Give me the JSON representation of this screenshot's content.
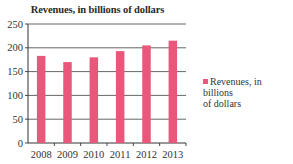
{
  "chart_data": {
    "type": "bar",
    "title": "Revenues, in billions of dollars",
    "categories": [
      "2008",
      "2009",
      "2010",
      "2011",
      "2012",
      "2013"
    ],
    "series": [
      {
        "name": "Revenues, in billions of dollars",
        "values": [
          183,
          170,
          180,
          193,
          205,
          215
        ],
        "color": "#e9587a"
      }
    ],
    "xlabel": "",
    "ylabel": "",
    "ylim": [
      0,
      250
    ],
    "yticks": [
      0,
      50,
      100,
      150,
      200,
      250
    ],
    "grid": true,
    "legend_position": "right"
  },
  "legend": {
    "label_line1": "Revenues, in billions",
    "label_line2": "of dollars"
  }
}
